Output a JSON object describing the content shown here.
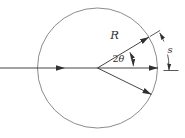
{
  "figure": {
    "labels": {
      "radius": "R",
      "angle_coefficient": "2",
      "angle_symbol": "θ",
      "arc_length": "s"
    },
    "colors": {
      "background": "#ffffff",
      "line": "#303030",
      "circle_outline": "#6e6e6e"
    }
  }
}
